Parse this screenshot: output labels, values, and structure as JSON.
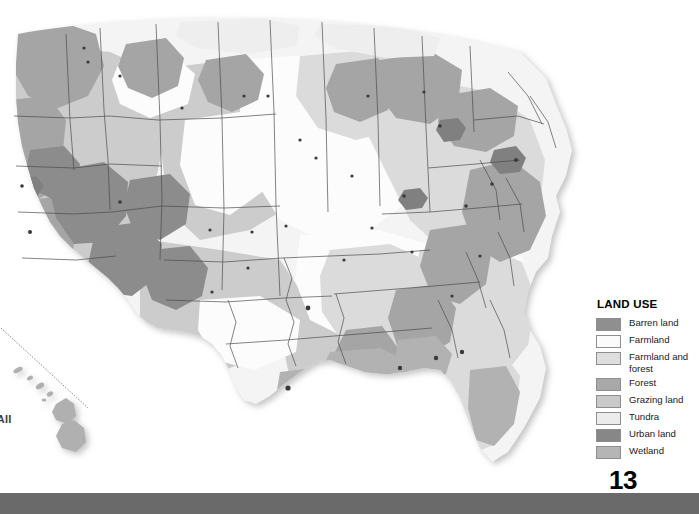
{
  "page": {
    "number": "13",
    "footer_color": "#6a6a6a",
    "background_color": "#ffffff"
  },
  "map": {
    "name": "united-states-land-use-map",
    "projection_note": "contiguous united states with hawaii inset",
    "insets": [
      {
        "label": "'VAII",
        "full_label": "HAWAII",
        "cropped": true
      }
    ]
  },
  "legend": {
    "title": "LAND USE",
    "items": [
      {
        "label": "Barren land",
        "color": "#8f8f8f"
      },
      {
        "label": "Farmland",
        "color": "#fbfbfb"
      },
      {
        "label": "Farmland and\nforest",
        "color": "#dedede"
      },
      {
        "label": "Forest",
        "color": "#a9a9a9"
      },
      {
        "label": "Grazing land",
        "color": "#c9c9c9"
      },
      {
        "label": "Tundra",
        "color": "#ececec"
      },
      {
        "label": "Urban land",
        "color": "#878787"
      },
      {
        "label": "Wetland",
        "color": "#b5b5b5"
      }
    ]
  },
  "map_colors": {
    "land_base": "#efefef",
    "state_border": "#4a4a4a",
    "city_dot": "#3a3a3a",
    "water": "#ffffff",
    "shadow": "#cfcfcf"
  }
}
